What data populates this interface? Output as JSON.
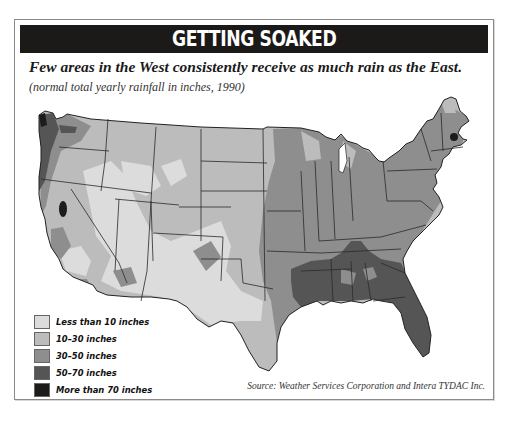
{
  "title": "GETTING SOAKED",
  "subtitle": "Few areas in the West consistently receive as much rain as the East.",
  "note": "(normal total yearly rainfall in inches, 1990)",
  "source": "Source: Weather Services Corporation and Intera TYDAC Inc.",
  "map": {
    "region": "Contiguous United States",
    "variable": "Normal total yearly rainfall (inches)",
    "year": 1990,
    "classes": [
      {
        "label": "Less than 10 inches",
        "color": "#dcdcdc"
      },
      {
        "label": "10–30 inches",
        "color": "#bcbcbc"
      },
      {
        "label": "30–50 inches",
        "color": "#8e8e8e"
      },
      {
        "label": "50–70 inches",
        "color": "#555555"
      },
      {
        "label": "More than 70 inches",
        "color": "#1e1c1a"
      }
    ],
    "highlights": [
      "Pacific Northwest coast: 50–70 to more than 70 inches",
      "Northern California Sierra: more than 70 inches",
      "Southeast / Gulf Coast (LA, MS, AL, FL): 50–70 inches",
      "Eastern half of US: mostly 30–50 inches",
      "Great Basin and Southwest: less than 10 to 10–30 inches",
      "New Hampshire peak: more than 70 inches"
    ]
  },
  "legend": {
    "items": [
      {
        "label": "Less than 10 inches",
        "color": "#dcdcdc"
      },
      {
        "label": "10–30 inches",
        "color": "#bcbcbc"
      },
      {
        "label": "30–50 inches",
        "color": "#8e8e8e"
      },
      {
        "label": "50–70 inches",
        "color": "#555555"
      },
      {
        "label": "More than 70 inches",
        "color": "#1e1c1a"
      }
    ]
  }
}
